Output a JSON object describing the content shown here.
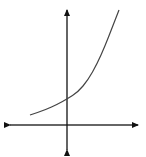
{
  "chart_data": {
    "type": "line",
    "title": "",
    "xlabel": "",
    "ylabel": "",
    "grid": false,
    "legend": null,
    "axes": {
      "x_axis_pixel_y": 125,
      "y_axis_pixel_x": 67,
      "arrows": [
        "left",
        "right",
        "up",
        "down"
      ]
    },
    "series": [
      {
        "name": "exponential",
        "points_px": [
          [
            30,
            115
          ],
          [
            45,
            110
          ],
          [
            58,
            104
          ],
          [
            67,
            99
          ],
          [
            78,
            92
          ],
          [
            88,
            80
          ],
          [
            97,
            64
          ],
          [
            105,
            46
          ],
          [
            112,
            28
          ],
          [
            119,
            10
          ]
        ]
      }
    ],
    "colors": {
      "axis": "#111111",
      "curve": "#444444"
    }
  }
}
